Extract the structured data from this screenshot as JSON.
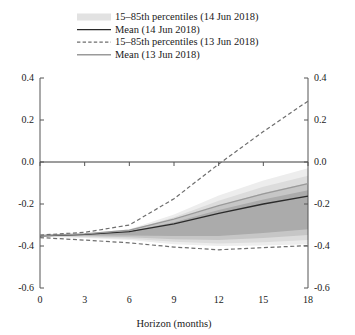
{
  "chart_data": {
    "type": "area",
    "title": "",
    "xlabel": "Horizon (months)",
    "ylabel": "",
    "xlim": [
      0,
      18
    ],
    "ylim": [
      -0.6,
      0.4
    ],
    "xticks": [
      0,
      3,
      6,
      9,
      12,
      15,
      18
    ],
    "yticks": [
      0.4,
      0.2,
      0.0,
      -0.2,
      -0.4,
      -0.6
    ],
    "xtick_labels": [
      "0",
      "3",
      "6",
      "9",
      "12",
      "15",
      "18"
    ],
    "ytick_labels": [
      "0.4",
      "0.2",
      "0.0",
      "-0.2",
      "-0.4",
      "-0.6"
    ],
    "grid": false,
    "zero_line": true,
    "legend_position": "top-center",
    "legend": [
      {
        "label": "15–85th percentiles (14 Jun 2018)",
        "marker": "swatch",
        "color": "#e2e2e2"
      },
      {
        "label": "Mean (14 Jun 2018)",
        "marker": "solid-line",
        "color": "#2b2b2b"
      },
      {
        "label": "15–85th percentiles (13 Jun 2018)",
        "marker": "dashed-line",
        "color": "#6e6e6e"
      },
      {
        "label": "Mean (13 Jun 2018)",
        "marker": "solid-line",
        "color": "#9a9a9a"
      }
    ],
    "x": [
      0,
      3,
      6,
      9,
      12,
      15,
      18
    ],
    "series": [
      {
        "name": "Mean (14 Jun 2018)",
        "style": "solid",
        "color": "#2b2b2b",
        "values": [
          -0.352,
          -0.345,
          -0.332,
          -0.295,
          -0.245,
          -0.2,
          -0.162
        ]
      },
      {
        "name": "Mean (13 Jun 2018)",
        "style": "solid",
        "color": "#9a9a9a",
        "values": [
          -0.35,
          -0.342,
          -0.325,
          -0.272,
          -0.208,
          -0.152,
          -0.103
        ]
      },
      {
        "name": "15–85th percentiles (13 Jun 2018) upper",
        "style": "dashed",
        "color": "#6e6e6e",
        "values": [
          -0.348,
          -0.335,
          -0.3,
          -0.175,
          -0.01,
          0.145,
          0.29
        ]
      },
      {
        "name": "15–85th percentiles (13 Jun 2018) lower",
        "style": "dashed",
        "color": "#6e6e6e",
        "values": [
          -0.36,
          -0.372,
          -0.385,
          -0.405,
          -0.418,
          -0.408,
          -0.398
        ]
      }
    ],
    "bands": [
      {
        "name": "outer",
        "fill": "#ededed",
        "upper": [
          -0.35,
          -0.34,
          -0.32,
          -0.25,
          -0.16,
          -0.088,
          -0.03
        ],
        "lower": [
          -0.356,
          -0.362,
          -0.372,
          -0.392,
          -0.4,
          -0.398,
          -0.392
        ]
      },
      {
        "name": "mid-outer",
        "fill": "#dcdcdc",
        "upper": [
          -0.351,
          -0.342,
          -0.325,
          -0.263,
          -0.185,
          -0.118,
          -0.065
        ],
        "lower": [
          -0.355,
          -0.358,
          -0.365,
          -0.38,
          -0.388,
          -0.382,
          -0.372
        ]
      },
      {
        "name": "mid-inner",
        "fill": "#c6c6c6",
        "upper": [
          -0.351,
          -0.343,
          -0.328,
          -0.275,
          -0.208,
          -0.148,
          -0.1
        ],
        "lower": [
          -0.354,
          -0.354,
          -0.358,
          -0.368,
          -0.372,
          -0.362,
          -0.348
        ]
      },
      {
        "name": "inner",
        "fill": "#ababab",
        "upper": [
          -0.352,
          -0.344,
          -0.331,
          -0.287,
          -0.228,
          -0.178,
          -0.135
        ],
        "lower": [
          -0.353,
          -0.35,
          -0.35,
          -0.352,
          -0.352,
          -0.338,
          -0.32
        ]
      }
    ]
  },
  "axes": {
    "left_labels": [
      "0.4",
      "0.2",
      "0.0",
      "-0.2",
      "-0.4",
      "-0.6"
    ],
    "right_labels": [
      "0.4",
      "0.2",
      "0.0",
      "-0.2",
      "-0.4",
      "-0.6"
    ],
    "x_labels": [
      "0",
      "3",
      "6",
      "9",
      "12",
      "15",
      "18"
    ],
    "x_title": "Horizon (months)"
  }
}
